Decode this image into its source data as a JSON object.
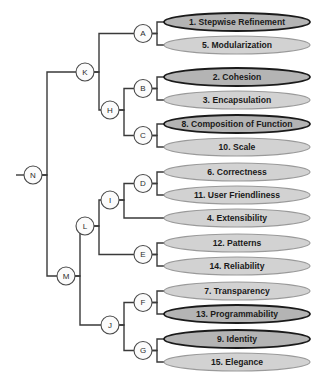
{
  "diagram": {
    "type": "dendrogram",
    "title": "",
    "orientation": "horizontal-left-root",
    "colors": {
      "leaf_fill_dark": "#b4b4b4",
      "leaf_fill_light": "#d2d2d2",
      "leaf_stroke_dark": "#1a1a1a",
      "leaf_stroke_light": "#9a9a9a",
      "node_fill": "#fbfbfb",
      "node_stroke": "#4a4a4a",
      "link_stroke": "#3a3a3a",
      "background": "#ffffff",
      "text": "#1a1a1a"
    },
    "leaves": [
      {
        "id": "L1",
        "label": "1. Stepwise Refinement",
        "style": "dark",
        "cx": 237,
        "cy": 22,
        "rx": 73,
        "ry": 9
      },
      {
        "id": "L2",
        "label": "5. Modularization",
        "style": "light",
        "cx": 237,
        "cy": 45,
        "rx": 73,
        "ry": 9
      },
      {
        "id": "L3",
        "label": "2. Cohesion",
        "style": "dark",
        "cx": 237,
        "cy": 77,
        "rx": 73,
        "ry": 9
      },
      {
        "id": "L4",
        "label": "3. Encapsulation",
        "style": "light",
        "cx": 237,
        "cy": 100,
        "rx": 73,
        "ry": 9
      },
      {
        "id": "L5",
        "label": "8. Composition of Function",
        "style": "dark",
        "cx": 237,
        "cy": 124,
        "rx": 73,
        "ry": 9
      },
      {
        "id": "L6",
        "label": "10. Scale",
        "style": "light",
        "cx": 237,
        "cy": 147,
        "rx": 73,
        "ry": 9
      },
      {
        "id": "L7",
        "label": "6. Correctness",
        "style": "light",
        "cx": 237,
        "cy": 172,
        "rx": 73,
        "ry": 9
      },
      {
        "id": "L8",
        "label": "11. User Friendliness",
        "style": "light",
        "cx": 237,
        "cy": 195,
        "rx": 73,
        "ry": 9
      },
      {
        "id": "L9",
        "label": "4. Extensibility",
        "style": "light",
        "cx": 237,
        "cy": 218,
        "rx": 73,
        "ry": 9
      },
      {
        "id": "L10",
        "label": "12. Patterns",
        "style": "light",
        "cx": 237,
        "cy": 243,
        "rx": 73,
        "ry": 9
      },
      {
        "id": "L11",
        "label": "14. Reliability",
        "style": "light",
        "cx": 237,
        "cy": 266,
        "rx": 73,
        "ry": 9
      },
      {
        "id": "L12",
        "label": "7. Transparency",
        "style": "light",
        "cx": 237,
        "cy": 291,
        "rx": 73,
        "ry": 9
      },
      {
        "id": "L13",
        "label": "13. Programmability",
        "style": "dark",
        "cx": 237,
        "cy": 314,
        "rx": 73,
        "ry": 9
      },
      {
        "id": "L14",
        "label": "9. Identity",
        "style": "dark",
        "cx": 237,
        "cy": 339,
        "rx": 73,
        "ry": 9
      },
      {
        "id": "L15",
        "label": "15. Elegance",
        "style": "light",
        "cx": 237,
        "cy": 362,
        "rx": 73,
        "ry": 9
      }
    ],
    "nodes": [
      {
        "id": "A",
        "label": "A",
        "cx": 143,
        "cy": 33.5,
        "r": 9,
        "children": [
          "L1",
          "L2"
        ]
      },
      {
        "id": "B",
        "label": "B",
        "cx": 143,
        "cy": 88.5,
        "r": 9,
        "children": [
          "L3",
          "L4"
        ]
      },
      {
        "id": "C",
        "label": "C",
        "cx": 143,
        "cy": 135.5,
        "r": 9,
        "children": [
          "L5",
          "L6"
        ]
      },
      {
        "id": "D",
        "label": "D",
        "cx": 143,
        "cy": 183.5,
        "r": 9,
        "children": [
          "L7",
          "L8"
        ]
      },
      {
        "id": "E",
        "label": "E",
        "cx": 143,
        "cy": 254.5,
        "r": 9,
        "children": [
          "L10",
          "L11"
        ]
      },
      {
        "id": "F",
        "label": "F",
        "cx": 143,
        "cy": 302.5,
        "r": 9,
        "children": [
          "L12",
          "L13"
        ]
      },
      {
        "id": "G",
        "label": "G",
        "cx": 143,
        "cy": 350.5,
        "r": 9,
        "children": [
          "L14",
          "L15"
        ]
      },
      {
        "id": "H",
        "label": "H",
        "cx": 110,
        "cy": 110,
        "r": 9,
        "children": [
          "B",
          "C"
        ]
      },
      {
        "id": "I",
        "label": "I",
        "cx": 110,
        "cy": 200,
        "r": 9,
        "children": [
          "D",
          "L9"
        ]
      },
      {
        "id": "J",
        "label": "J",
        "cx": 110,
        "cy": 325,
        "r": 9,
        "children": [
          "F",
          "G"
        ]
      },
      {
        "id": "K",
        "label": "K",
        "cx": 85,
        "cy": 72,
        "r": 9,
        "children": [
          "A",
          "H"
        ]
      },
      {
        "id": "L",
        "label": "L",
        "cx": 85,
        "cy": 226,
        "r": 9,
        "children": [
          "I",
          "E"
        ]
      },
      {
        "id": "M",
        "label": "M",
        "cx": 66,
        "cy": 276,
        "r": 9,
        "children": [
          "L",
          "J"
        ]
      },
      {
        "id": "N",
        "label": "N",
        "cx": 33,
        "cy": 175,
        "r": 9,
        "children": [
          "K",
          "M"
        ]
      }
    ],
    "links": [
      {
        "from": "A",
        "to": "L1"
      },
      {
        "from": "A",
        "to": "L2"
      },
      {
        "from": "B",
        "to": "L3"
      },
      {
        "from": "B",
        "to": "L4"
      },
      {
        "from": "C",
        "to": "L5"
      },
      {
        "from": "C",
        "to": "L6"
      },
      {
        "from": "D",
        "to": "L7"
      },
      {
        "from": "D",
        "to": "L8"
      },
      {
        "from": "E",
        "to": "L10"
      },
      {
        "from": "E",
        "to": "L11"
      },
      {
        "from": "F",
        "to": "L12"
      },
      {
        "from": "F",
        "to": "L13"
      },
      {
        "from": "G",
        "to": "L14"
      },
      {
        "from": "G",
        "to": "L15"
      },
      {
        "from": "H",
        "to": "B"
      },
      {
        "from": "H",
        "to": "C"
      },
      {
        "from": "I",
        "to": "D"
      },
      {
        "from": "I",
        "to": "L9"
      },
      {
        "from": "J",
        "to": "F"
      },
      {
        "from": "J",
        "to": "G"
      },
      {
        "from": "K",
        "to": "A"
      },
      {
        "from": "K",
        "to": "H"
      },
      {
        "from": "L",
        "to": "I"
      },
      {
        "from": "L",
        "to": "E"
      },
      {
        "from": "M",
        "to": "L"
      },
      {
        "from": "M",
        "to": "J"
      },
      {
        "from": "N",
        "to": "K"
      },
      {
        "from": "N",
        "to": "M"
      }
    ],
    "root_stub": {
      "x1": 16,
      "y1": 175,
      "x2": 24,
      "y2": 175
    }
  }
}
